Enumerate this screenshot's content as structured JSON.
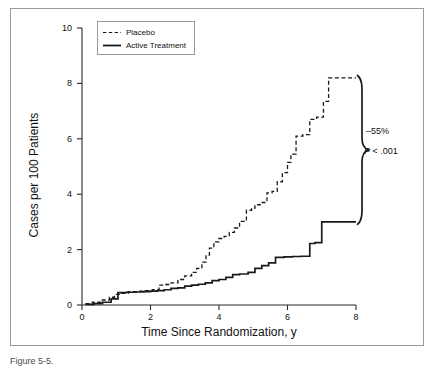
{
  "figure": {
    "caption": "Figure 5-5.",
    "background": "#ffffff",
    "frame_color": "#9a9a9a"
  },
  "legend": {
    "position": "top-left-inside",
    "entries": [
      {
        "label": "Placebo",
        "style": "dashed",
        "color": "#1a1a1a"
      },
      {
        "label": "Active Treatment",
        "style": "solid",
        "color": "#1a1a1a"
      }
    ]
  },
  "annotations": {
    "reduction": "–55%",
    "p_value_italic": "P",
    "p_value_rest": " < .001",
    "brace": "curly-brace-right"
  },
  "chart_data": {
    "type": "line",
    "subtype": "step",
    "title": "",
    "xlabel": "Time Since Randomization, y",
    "ylabel": "Cases per 100 Patients",
    "xlim": [
      0,
      8
    ],
    "ylim": [
      0,
      10
    ],
    "xticks": [
      0,
      2,
      4,
      6,
      8
    ],
    "yticks": [
      0,
      2,
      4,
      6,
      8,
      10
    ],
    "xtick_labels": [
      "0",
      "2",
      "4",
      "6",
      "8"
    ],
    "ytick_labels": [
      "0",
      "2",
      "4",
      "6",
      "8",
      "10"
    ],
    "grid": false,
    "legend_position": "upper left",
    "series": [
      {
        "name": "Placebo",
        "style": "dashed",
        "color": "#1a1a1a",
        "x": [
          0.1,
          0.3,
          0.55,
          0.8,
          0.95,
          1.15,
          1.35,
          1.6,
          1.85,
          2.05,
          2.25,
          2.45,
          2.6,
          2.8,
          3.0,
          3.2,
          3.35,
          3.5,
          3.62,
          3.72,
          3.85,
          4.0,
          4.15,
          4.3,
          4.45,
          4.6,
          4.8,
          4.95,
          5.05,
          5.2,
          5.4,
          5.55,
          5.7,
          5.85,
          6.0,
          6.1,
          6.25,
          6.45,
          6.65,
          6.85,
          7.05,
          7.2,
          8.0
        ],
        "y": [
          0.05,
          0.1,
          0.18,
          0.28,
          0.38,
          0.42,
          0.48,
          0.5,
          0.52,
          0.55,
          0.72,
          0.74,
          0.8,
          0.92,
          1.05,
          1.18,
          1.32,
          1.55,
          1.8,
          2.05,
          2.28,
          2.4,
          2.48,
          2.62,
          2.78,
          3.02,
          3.42,
          3.5,
          3.62,
          3.7,
          4.05,
          4.1,
          4.45,
          4.78,
          5.15,
          5.45,
          6.1,
          6.15,
          6.7,
          6.78,
          7.35,
          8.2,
          8.2
        ]
      },
      {
        "name": "Active Treatment",
        "style": "solid",
        "color": "#1a1a1a",
        "x": [
          0.1,
          0.35,
          0.6,
          0.85,
          1.05,
          1.3,
          1.55,
          1.8,
          2.0,
          2.2,
          2.4,
          2.6,
          2.8,
          3.0,
          3.2,
          3.4,
          3.6,
          3.8,
          4.0,
          4.2,
          4.4,
          4.6,
          4.85,
          5.05,
          5.25,
          5.45,
          5.65,
          5.9,
          6.15,
          6.4,
          6.65,
          6.8,
          7.0,
          7.2,
          8.0
        ],
        "y": [
          0.02,
          0.05,
          0.1,
          0.22,
          0.45,
          0.46,
          0.47,
          0.48,
          0.5,
          0.52,
          0.55,
          0.6,
          0.62,
          0.68,
          0.72,
          0.75,
          0.8,
          0.88,
          0.92,
          1.0,
          1.1,
          1.12,
          1.18,
          1.32,
          1.42,
          1.52,
          1.72,
          1.74,
          1.75,
          1.76,
          2.22,
          2.25,
          3.0,
          3.0,
          3.0
        ]
      }
    ],
    "final_values": {
      "Placebo": 8.2,
      "Active Treatment": 3.0
    },
    "relative_reduction_percent": -55,
    "p_value": "< .001"
  }
}
